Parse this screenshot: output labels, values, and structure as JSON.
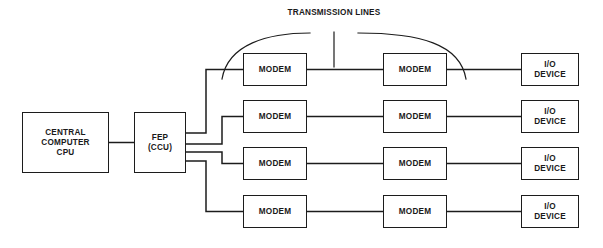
{
  "diagram": {
    "background_color": "#ffffff",
    "line_color": "#1c1c1c",
    "text_color": "#1a1a1a",
    "annotations": {
      "transmission_lines": {
        "line1": "TRANSMISSION",
        "line2": "LINES"
      }
    },
    "nodes": {
      "cpu": {
        "line1": "CENTRAL",
        "line2": "COMPUTER",
        "line3": "CPU"
      },
      "fep": {
        "line1": "FEP",
        "line2": "(CCU)"
      },
      "modem_label": "MODEM",
      "io_device": {
        "line1": "I/O",
        "line2": "DEVICE"
      }
    },
    "rows": [
      {
        "index": 1,
        "near_modem": "MODEM",
        "far_modem": "MODEM",
        "io_line1": "I/O",
        "io_line2": "DEVICE"
      },
      {
        "index": 2,
        "near_modem": "MODEM",
        "far_modem": "MODEM",
        "io_line1": "I/O",
        "io_line2": "DEVICE"
      },
      {
        "index": 3,
        "near_modem": "MODEM",
        "far_modem": "MODEM",
        "io_line1": "I/O",
        "io_line2": "DEVICE"
      },
      {
        "index": 4,
        "near_modem": "MODEM",
        "far_modem": "MODEM",
        "io_line1": "I/O",
        "io_line2": "DEVICE"
      }
    ]
  }
}
